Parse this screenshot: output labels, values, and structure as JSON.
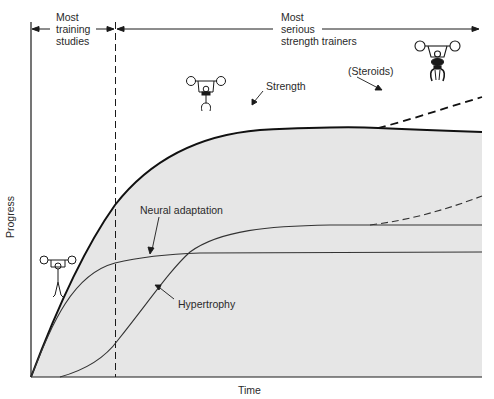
{
  "figure": {
    "axes": {
      "x_label": "Time",
      "y_label": "Progress"
    },
    "phases": [
      {
        "label": "Most\ntraining\nstudies",
        "span": "start-to-dashed-line"
      },
      {
        "label": "Most\nserious\nstrength trainers",
        "span": "dashed-line-onward"
      }
    ],
    "curves": [
      {
        "name": "Strength",
        "label": "Strength",
        "style": "solid-thick"
      },
      {
        "name": "Steroids",
        "label": "(Steroids)",
        "style": "dashed",
        "branch_of": "Strength"
      },
      {
        "name": "Neural adaptation",
        "label": "Neural adaptation",
        "style": "solid"
      },
      {
        "name": "Hypertrophy",
        "label": "Hypertrophy",
        "style": "solid",
        "dashed_extension": true
      }
    ],
    "illustrations": [
      "weightlifter-stick-figure-small",
      "weightlifter-stick-figure-medium",
      "weightlifter-stick-figure-muscular"
    ],
    "colors": {
      "line": "#1a1a1a",
      "shade": "#e6e6e6",
      "text": "#2a2a2a"
    }
  }
}
